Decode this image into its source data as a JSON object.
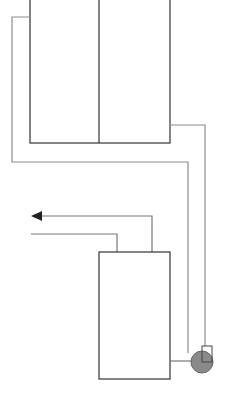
{
  "diagram": {
    "type": "schematic",
    "colors": {
      "background": "#ffffff",
      "tank_outline": "#333333",
      "pipe": "#8c8c8c",
      "pump_fill": "#8a8a8a",
      "pump_outline": "#555555",
      "arrow": "#222222"
    },
    "components": {
      "upper_tank": {
        "compartments": 2
      },
      "lower_tank": {
        "compartments": 1
      },
      "pump": {
        "symbol": "circle-with-square"
      },
      "outlet_arrow": {
        "direction": "left"
      }
    }
  }
}
